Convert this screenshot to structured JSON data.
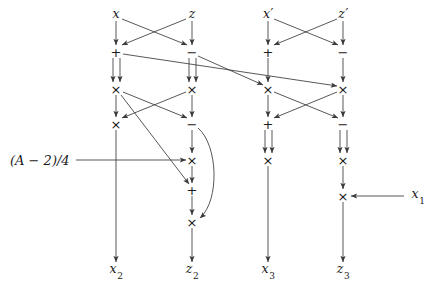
{
  "figure": {
    "kind": "arithmetic-circuit-diagram",
    "width": 437,
    "height": 288,
    "background_color": "#ffffff",
    "line_color": "#3a3a3a",
    "text_color": "#1a1a1a"
  },
  "inputs": [
    {
      "id": "in-x",
      "label": "x",
      "sub": "",
      "prime": false,
      "x": 116,
      "y": 14
    },
    {
      "id": "in-z",
      "label": "z",
      "sub": "",
      "prime": false,
      "x": 192,
      "y": 14
    },
    {
      "id": "in-xp",
      "label": "x",
      "sub": "",
      "prime": true,
      "x": 268,
      "y": 14
    },
    {
      "id": "in-zp",
      "label": "z",
      "sub": "",
      "prime": true,
      "x": 343,
      "y": 14
    }
  ],
  "outputs": [
    {
      "id": "out-x2",
      "label": "x",
      "sub": "2",
      "prime": false,
      "x": 116,
      "y": 271
    },
    {
      "id": "out-z2",
      "label": "z",
      "sub": "2",
      "prime": false,
      "x": 192,
      "y": 271
    },
    {
      "id": "out-x3",
      "label": "x",
      "sub": "3",
      "prime": false,
      "x": 268,
      "y": 271
    },
    {
      "id": "out-z3",
      "label": "z",
      "sub": "3",
      "prime": false,
      "x": 343,
      "y": 271
    }
  ],
  "constants": [
    {
      "id": "const-a",
      "text": "(A − 2)/4",
      "x": 10,
      "y": 160,
      "align": "left"
    },
    {
      "id": "const-x1",
      "label": "x",
      "sub": "1",
      "x": 413,
      "y": 196,
      "align": "left"
    }
  ],
  "operators": [
    {
      "id": "op-c1-add1",
      "symbol": "+",
      "x": 116,
      "y": 52,
      "column": 1,
      "row": 1
    },
    {
      "id": "op-c2-sub1",
      "symbol": "−",
      "x": 192,
      "y": 52,
      "column": 2,
      "row": 1
    },
    {
      "id": "op-c3-add1",
      "symbol": "+",
      "x": 268,
      "y": 52,
      "column": 3,
      "row": 1
    },
    {
      "id": "op-c4-sub1",
      "symbol": "−",
      "x": 343,
      "y": 52,
      "column": 4,
      "row": 1
    },
    {
      "id": "op-c1-mul1",
      "symbol": "×",
      "x": 116,
      "y": 89,
      "column": 1,
      "row": 2
    },
    {
      "id": "op-c2-mul1",
      "symbol": "×",
      "x": 192,
      "y": 89,
      "column": 2,
      "row": 2
    },
    {
      "id": "op-c3-mul1",
      "symbol": "×",
      "x": 268,
      "y": 89,
      "column": 3,
      "row": 2
    },
    {
      "id": "op-c4-mul1",
      "symbol": "×",
      "x": 343,
      "y": 89,
      "column": 4,
      "row": 2
    },
    {
      "id": "op-c1-mul2",
      "symbol": "×",
      "x": 116,
      "y": 124,
      "column": 1,
      "row": 3
    },
    {
      "id": "op-c2-sub2",
      "symbol": "−",
      "x": 192,
      "y": 124,
      "column": 2,
      "row": 3
    },
    {
      "id": "op-c3-add2",
      "symbol": "+",
      "x": 268,
      "y": 124,
      "column": 3,
      "row": 3
    },
    {
      "id": "op-c4-sub2",
      "symbol": "−",
      "x": 343,
      "y": 124,
      "column": 4,
      "row": 3
    },
    {
      "id": "op-c2-mul2",
      "symbol": "×",
      "x": 192,
      "y": 160,
      "column": 2,
      "row": 4
    },
    {
      "id": "op-c3-mul2",
      "symbol": "×",
      "x": 268,
      "y": 160,
      "column": 3,
      "row": 4
    },
    {
      "id": "op-c4-mul2",
      "symbol": "×",
      "x": 343,
      "y": 160,
      "column": 4,
      "row": 4
    },
    {
      "id": "op-c2-add1",
      "symbol": "+",
      "x": 192,
      "y": 190,
      "column": 2,
      "row": 5
    },
    {
      "id": "op-c4-mul3",
      "symbol": "×",
      "x": 343,
      "y": 196,
      "column": 4,
      "row": 5
    },
    {
      "id": "op-c2-mul3",
      "symbol": "×",
      "x": 192,
      "y": 222,
      "column": 2,
      "row": 6
    }
  ],
  "edges": [
    {
      "id": "e-x-to-c1add",
      "from": "in-x",
      "to": "op-c1-add1",
      "style": "straight"
    },
    {
      "id": "e-z-to-c2sub",
      "from": "in-z",
      "to": "op-c2-sub1",
      "style": "straight"
    },
    {
      "id": "e-x-to-c2sub",
      "from": "in-x",
      "to": "op-c2-sub1",
      "style": "cross"
    },
    {
      "id": "e-z-to-c1add",
      "from": "in-z",
      "to": "op-c1-add1",
      "style": "cross"
    },
    {
      "id": "e-xp-to-c3add",
      "from": "in-xp",
      "to": "op-c3-add1",
      "style": "straight"
    },
    {
      "id": "e-zp-to-c4sub",
      "from": "in-zp",
      "to": "op-c4-sub1",
      "style": "straight"
    },
    {
      "id": "e-xp-to-c4sub",
      "from": "in-xp",
      "to": "op-c4-sub1",
      "style": "cross"
    },
    {
      "id": "e-zp-to-c3add",
      "from": "in-zp",
      "to": "op-c3-add1",
      "style": "cross"
    },
    {
      "id": "e-c1add-sq",
      "from": "op-c1-add1",
      "to": "op-c1-mul1",
      "style": "double"
    },
    {
      "id": "e-c2sub-sq",
      "from": "op-c2-sub1",
      "to": "op-c2-mul1",
      "style": "double"
    },
    {
      "id": "e-c1add-c4mul",
      "from": "op-c1-add1",
      "to": "op-c4-mul1",
      "style": "long-diagonal"
    },
    {
      "id": "e-c2sub-c3mul",
      "from": "op-c2-sub1",
      "to": "op-c3-mul1",
      "style": "long-diagonal"
    },
    {
      "id": "e-c3add-c3mul",
      "from": "op-c3-add1",
      "to": "op-c3-mul1",
      "style": "straight"
    },
    {
      "id": "e-c4sub-c4mul",
      "from": "op-c4-sub1",
      "to": "op-c4-mul1",
      "style": "straight"
    },
    {
      "id": "e-c1mul-c1mul2",
      "from": "op-c1-mul1",
      "to": "op-c1-mul2",
      "style": "straight"
    },
    {
      "id": "e-c2mul-c2sub2",
      "from": "op-c2-mul1",
      "to": "op-c2-sub2",
      "style": "straight"
    },
    {
      "id": "e-c1mul-c2sub2",
      "from": "op-c1-mul1",
      "to": "op-c2-sub2",
      "style": "cross"
    },
    {
      "id": "e-c2mul-c1mul2",
      "from": "op-c2-mul1",
      "to": "op-c1-mul2",
      "style": "cross"
    },
    {
      "id": "e-c1mul-c2add",
      "from": "op-c1-mul1",
      "to": "op-c2-add1",
      "style": "long-diagonal"
    },
    {
      "id": "e-c3mul-c3add2",
      "from": "op-c3-mul1",
      "to": "op-c3-add2",
      "style": "straight"
    },
    {
      "id": "e-c4mul-c4sub2",
      "from": "op-c4-mul1",
      "to": "op-c4-sub2",
      "style": "straight"
    },
    {
      "id": "e-c3mul-c4sub2",
      "from": "op-c3-mul1",
      "to": "op-c4-sub2",
      "style": "cross"
    },
    {
      "id": "e-c4mul-c3add2",
      "from": "op-c4-mul1",
      "to": "op-c3-add2",
      "style": "cross"
    },
    {
      "id": "e-consta-c2mul2",
      "from": "const-a",
      "to": "op-c2-mul2",
      "style": "horizontal"
    },
    {
      "id": "e-c2sub2-c2mul2",
      "from": "op-c2-sub2",
      "to": "op-c2-mul2",
      "style": "straight"
    },
    {
      "id": "e-c2sub2-curve",
      "from": "op-c2-sub2",
      "to": "op-c2-mul3",
      "style": "curve"
    },
    {
      "id": "e-c2mul2-c2add",
      "from": "op-c2-mul2",
      "to": "op-c2-add1",
      "style": "straight"
    },
    {
      "id": "e-c2add-c2mul3",
      "from": "op-c2-add1",
      "to": "op-c2-mul3",
      "style": "straight"
    },
    {
      "id": "e-c3add2-sq",
      "from": "op-c3-add2",
      "to": "op-c3-mul2",
      "style": "double"
    },
    {
      "id": "e-c4sub2-sq",
      "from": "op-c4-sub2",
      "to": "op-c4-mul2",
      "style": "double"
    },
    {
      "id": "e-c4mul2-c4mul3",
      "from": "op-c4-mul2",
      "to": "op-c4-mul3",
      "style": "straight"
    },
    {
      "id": "e-x1-c4mul3",
      "from": "const-x1",
      "to": "op-c4-mul3",
      "style": "horizontal-left"
    },
    {
      "id": "e-c1mul2-out",
      "from": "op-c1-mul2",
      "to": "out-x2",
      "style": "straight"
    },
    {
      "id": "e-c2mul3-out",
      "from": "op-c2-mul3",
      "to": "out-z2",
      "style": "straight"
    },
    {
      "id": "e-c3mul2-out",
      "from": "op-c3-mul2",
      "to": "out-x3",
      "style": "straight"
    },
    {
      "id": "e-c4mul3-out",
      "from": "op-c4-mul3",
      "to": "out-z3",
      "style": "straight"
    }
  ]
}
